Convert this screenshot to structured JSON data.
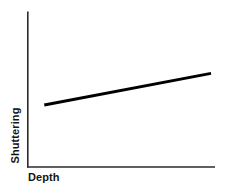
{
  "chart_data": {
    "type": "line",
    "title": "",
    "subtitle": "",
    "xlabel": "Depth",
    "ylabel": "Shuttering",
    "grid": false,
    "legend": false,
    "legend_position": "none",
    "axis_ticks": false,
    "tick_labels_x": [],
    "tick_labels_y": [],
    "xlim": [
      0,
      1
    ],
    "ylim": [
      0,
      1
    ],
    "annotations": [],
    "series": [
      {
        "name": "shuttering-vs-depth",
        "style": "solid",
        "color": "#000000",
        "line_width": 3,
        "markers": false,
        "x": [
          0.09,
          1.0
        ],
        "y": [
          0.41,
          0.62
        ],
        "description": "Gently increasing straight line"
      }
    ],
    "axis_color": "#2b2b2b",
    "background_color": "#ffffff"
  },
  "labels": {
    "x_axis": "Depth",
    "y_axis": "Shuttering"
  },
  "icons": {
    "x_axis_line": "horizontal-axis-icon",
    "y_axis_line": "vertical-axis-icon"
  }
}
